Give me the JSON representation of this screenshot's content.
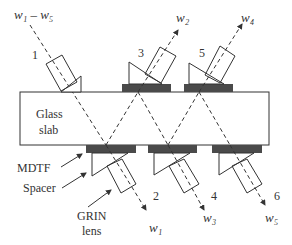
{
  "diagram": {
    "type": "optical demultiplexer schematic",
    "slab_label_line1": "Glass",
    "slab_label_line2": "slab",
    "input_label": "w₁ – w₅",
    "port_labels": [
      "1",
      "2",
      "3",
      "4",
      "5",
      "6"
    ],
    "output_labels": {
      "w1": "w₁",
      "w2": "w₂",
      "w3": "w₃",
      "w4": "w₄",
      "w5": "w₅"
    },
    "callouts": {
      "mdtf": "MDTF",
      "spacer": "Spacer",
      "grin_line1": "GRIN",
      "grin_line2": "lens"
    },
    "colors": {
      "filter": "#4a4a4a",
      "line": "#333333",
      "background": "#ffffff"
    }
  }
}
